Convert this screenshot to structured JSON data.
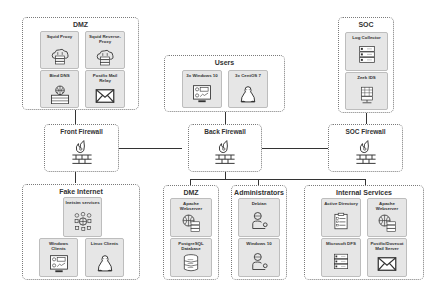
{
  "zones": {
    "dmz_top": {
      "title": "DMZ",
      "nodes": [
        {
          "label": "Squid Proxy",
          "icon": "cloud-server-icon"
        },
        {
          "label": "Squid Reverse-Proxy",
          "icon": "cloud-server-icon"
        },
        {
          "label": "Bind DNS",
          "icon": "globe-server-icon"
        },
        {
          "label": "Postfix Mail Relay",
          "icon": "mail-icon"
        }
      ]
    },
    "users": {
      "title": "Users",
      "nodes": [
        {
          "label": "3x Windows 10",
          "icon": "windows-workstation-icon"
        },
        {
          "label": "3x CentOS 7",
          "icon": "linux-penguin-icon"
        }
      ]
    },
    "soc": {
      "title": "SOC",
      "nodes": [
        {
          "label": "Log Collector",
          "icon": "server-rack-icon"
        },
        {
          "label": "Zeek IDS",
          "icon": "ids-sensor-icon"
        }
      ]
    },
    "fake_internet": {
      "title": "Fake Internet",
      "nodes": [
        {
          "label": "Inetsim services",
          "icon": "network-services-icon"
        },
        {
          "label": "Windows Clients",
          "icon": "windows-workstation-icon"
        },
        {
          "label": "Linux Clients",
          "icon": "linux-penguin-icon"
        }
      ]
    },
    "dmz_bottom": {
      "title": "DMZ",
      "nodes": [
        {
          "label": "Apache Webserver",
          "icon": "web-server-icon"
        },
        {
          "label": "PostgreSQL Database",
          "icon": "database-icon"
        }
      ]
    },
    "administrators": {
      "title": "Administrators",
      "nodes": [
        {
          "label": "Debian",
          "icon": "admin-user-icon"
        },
        {
          "label": "Windows 10",
          "icon": "admin-user-icon"
        }
      ]
    },
    "internal_services": {
      "title": "Internal Services",
      "nodes": [
        {
          "label": "Active Directory",
          "icon": "clipboard-list-icon"
        },
        {
          "label": "Apache Webserver",
          "icon": "web-server-icon"
        },
        {
          "label": "Microsoft DFS",
          "icon": "server-rack-icon"
        },
        {
          "label": "Postfix/Dovecot Mail Server",
          "icon": "mail-icon"
        }
      ]
    }
  },
  "firewalls": {
    "front": {
      "title": "Front Firewall",
      "icon": "firewall-icon"
    },
    "back": {
      "title": "Back Firewall",
      "icon": "firewall-icon"
    },
    "soc": {
      "title": "SOC Firewall",
      "icon": "firewall-icon"
    }
  },
  "colors": {
    "line": "#333333",
    "node_bg": "#e6e6e6",
    "border": "#7a7a7a"
  }
}
